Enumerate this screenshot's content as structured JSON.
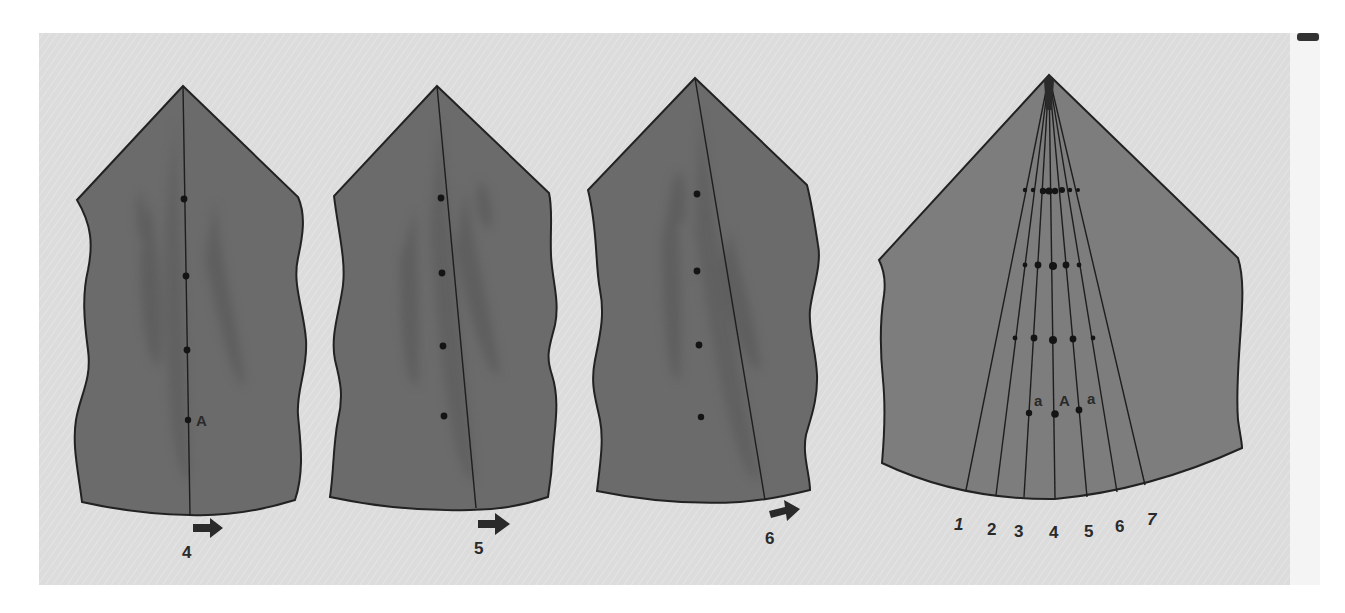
{
  "colors": {
    "page_background": "#ffffff",
    "panel_background": "#dcdcdc",
    "shape_fill_dark": "#6b6b6b",
    "shape_fill_light": "#7d7d7d",
    "streak_fill": "#5c5c5c",
    "outline": "#222222",
    "line": "#1e1e1e",
    "dot": "#141414",
    "text": "#2a2a2a"
  },
  "panels": [
    {
      "id": "panel-4",
      "step_label": "4",
      "point_label": "A",
      "dots": [
        [
          184,
          199
        ],
        [
          186,
          276
        ],
        [
          187,
          350
        ],
        [
          188,
          420
        ]
      ],
      "axis_line": [
        [
          183,
          86
        ],
        [
          190,
          515
        ]
      ],
      "arrow": {
        "x": 193,
        "y": 528
      },
      "label_pos": {
        "x": 188,
        "y": 558
      }
    },
    {
      "id": "panel-5",
      "step_label": "5",
      "dots": [
        [
          441,
          198
        ],
        [
          442,
          273
        ],
        [
          443,
          346
        ],
        [
          444,
          416
        ]
      ],
      "axis_line": [
        [
          437,
          86
        ],
        [
          476,
          508
        ]
      ],
      "arrow": {
        "x": 478,
        "y": 524
      },
      "label_pos": {
        "x": 480,
        "y": 554
      }
    },
    {
      "id": "panel-6",
      "step_label": "6",
      "dots": [
        [
          697,
          194
        ],
        [
          697,
          271
        ],
        [
          699,
          345
        ],
        [
          701,
          417
        ]
      ],
      "axis_line": [
        [
          695,
          78
        ],
        [
          765,
          500
        ]
      ],
      "arrow": {
        "x": 770,
        "y": 513
      },
      "label_pos": {
        "x": 771,
        "y": 544
      }
    }
  ],
  "summary_panel": {
    "id": "panel-combined",
    "apex": [
      1049,
      75
    ],
    "ray_ends": [
      [
        966,
        490
      ],
      [
        996,
        495
      ],
      [
        1024,
        497
      ],
      [
        1055,
        498
      ],
      [
        1087,
        497
      ],
      [
        1117,
        492
      ],
      [
        1145,
        485
      ]
    ],
    "ray_labels": [
      "1",
      "2",
      "3",
      "4",
      "5",
      "6",
      "7"
    ],
    "ray_label_positions": [
      [
        960,
        530
      ],
      [
        993,
        535
      ],
      [
        1020,
        537
      ],
      [
        1055,
        538
      ],
      [
        1090,
        537
      ],
      [
        1121,
        532
      ],
      [
        1153,
        525
      ]
    ],
    "dot_rows": [
      [
        [
          1025,
          190,
          2.2
        ],
        [
          1033,
          190,
          2.2
        ],
        [
          1043,
          191,
          3.2
        ],
        [
          1049,
          191,
          3.6
        ],
        [
          1055,
          191,
          3.2
        ],
        [
          1062,
          190,
          3
        ],
        [
          1070,
          190,
          2.2
        ],
        [
          1078,
          190,
          2
        ]
      ],
      [
        [
          1025,
          265,
          2.4
        ],
        [
          1038,
          265,
          3.4
        ],
        [
          1053,
          266,
          4
        ],
        [
          1066,
          265,
          3.4
        ],
        [
          1079,
          265,
          2.4
        ]
      ],
      [
        [
          1015,
          338,
          2.4
        ],
        [
          1034,
          338,
          3.4
        ],
        [
          1053,
          340,
          4
        ],
        [
          1073,
          339,
          3.4
        ],
        [
          1093,
          338,
          2.4
        ]
      ],
      [
        [
          1029,
          413,
          3.2
        ],
        [
          1055,
          414,
          3.8
        ],
        [
          1079,
          410,
          3.4
        ]
      ]
    ],
    "point_labels": [
      {
        "text": "a",
        "x": 1040,
        "y": 406
      },
      {
        "text": "A",
        "x": 1066,
        "y": 406
      },
      {
        "text": "a",
        "x": 1093,
        "y": 404
      }
    ]
  },
  "corner_mark": {
    "x": 1297,
    "y": 33,
    "w": 22,
    "h": 8
  }
}
